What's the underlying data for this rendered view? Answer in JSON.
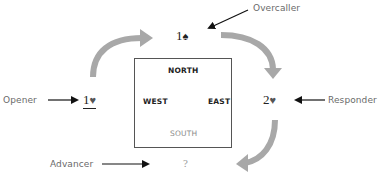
{
  "diagram": {
    "type": "bridge-bidding-sequence",
    "table": {
      "north": "NORTH",
      "south": "SOUTH",
      "east": "EAST",
      "west": "WEST"
    },
    "bids": {
      "opener": {
        "level": "1",
        "suit": "♥",
        "suit_name": "hearts",
        "underlined": true
      },
      "overcaller": {
        "level": "1",
        "suit": "♠",
        "suit_name": "spades"
      },
      "responder": {
        "level": "2",
        "suit": "♥",
        "suit_name": "hearts"
      },
      "advancer": {
        "text": "?"
      }
    },
    "roles": {
      "opener": "Opener",
      "overcaller": "Overcaller",
      "responder": "Responder",
      "advancer": "Advancer"
    },
    "colors": {
      "flow_arrow": "#a8a8a8",
      "pointer_arrow": "#111111",
      "role_text": "#6a6a6a",
      "box_border": "#555555"
    }
  }
}
